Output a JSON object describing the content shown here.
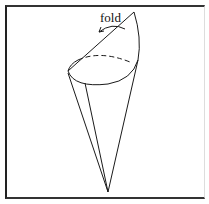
{
  "figure": {
    "annotation": "fold",
    "elements": [
      "cone",
      "opening-ellipse",
      "fold-flap",
      "fold-arrow"
    ]
  }
}
